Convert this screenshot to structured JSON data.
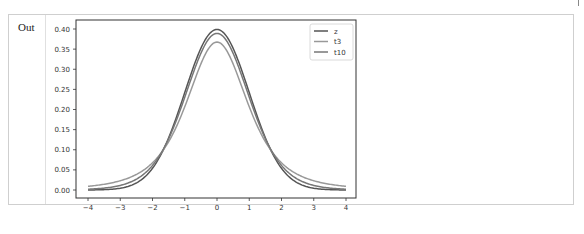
{
  "output_cell": {
    "prompt_label": "Out"
  },
  "chart_data": {
    "type": "line",
    "title": "",
    "xlabel": "",
    "ylabel": "",
    "xlim": [
      -4.1,
      4.1
    ],
    "ylim": [
      -0.02,
      0.42
    ],
    "grid": false,
    "legend_position": "upper right",
    "x_ticks": [
      "-4",
      "-3",
      "-2",
      "-1",
      "0",
      "1",
      "2",
      "3",
      "4"
    ],
    "y_ticks": [
      "0.00",
      "0.05",
      "0.10",
      "0.15",
      "0.20",
      "0.25",
      "0.30",
      "0.35",
      "0.40"
    ],
    "series": [
      {
        "name": "z",
        "color": "#555555",
        "description": "standard normal pdf",
        "x": [
          -4,
          -3,
          -2,
          -1,
          0,
          1,
          2,
          3,
          4
        ],
        "values": [
          0.0001,
          0.0044,
          0.054,
          0.242,
          0.399,
          0.242,
          0.054,
          0.0044,
          0.0001
        ]
      },
      {
        "name": "t3",
        "color": "#999999",
        "description": "Student t pdf, df=3",
        "x": [
          -4,
          -3,
          -2,
          -1,
          0,
          1,
          2,
          3,
          4
        ],
        "values": [
          0.0092,
          0.023,
          0.0675,
          0.2067,
          0.3676,
          0.2067,
          0.0675,
          0.023,
          0.0092
        ]
      },
      {
        "name": "t10",
        "color": "#777777",
        "description": "Student t pdf, df=10",
        "x": [
          -4,
          -3,
          -2,
          -1,
          0,
          1,
          2,
          3,
          4
        ],
        "values": [
          0.002,
          0.0114,
          0.0611,
          0.2304,
          0.3891,
          0.2304,
          0.0611,
          0.0114,
          0.002
        ]
      }
    ]
  }
}
